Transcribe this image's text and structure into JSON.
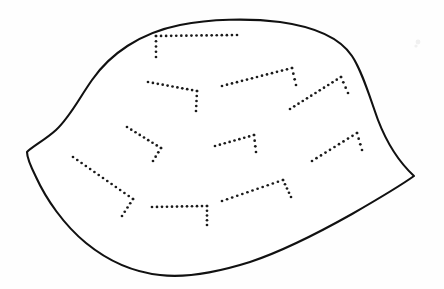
{
  "figure": {
    "title": "Shell outline with dotted growth-line markings",
    "domain_label": "line-drawing",
    "canvas": {
      "width": 444,
      "height": 289
    },
    "background_color": "#fefefe",
    "ink_color": "#111111",
    "dot_color": "#1a1a1a"
  },
  "outline": {
    "name": "shell-outline",
    "stroke_width": 2.1,
    "fill_color": "#ffffff",
    "description": "Closed lens/shell-shaped contour with a cusp at left and a cusp at right",
    "left_cusp": {
      "x": 27,
      "y": 152
    },
    "right_cusp": {
      "x": 414,
      "y": 176
    },
    "apex_top": {
      "x": 226,
      "y": 20
    },
    "apex_bottom": {
      "x": 170,
      "y": 275
    },
    "path": "M 27 152 C 33 146 45 140 56 130 C 70 117 78 100 92 80 C 110 54 140 33 180 25 C 210 19 248 18 280 22 C 316 27 340 38 352 56 C 362 71 369 95 378 120 C 388 146 400 163 414 176 C 400 186 378 199 352 214 C 320 232 286 250 250 262 C 215 273 185 278 160 275 C 132 272 108 261 86 243 C 64 225 46 199 36 177 C 30 165 27 157 27 152 Z"
  },
  "dotted_marks": [
    {
      "name": "mark-top-bracket",
      "dot_radius": 1.35,
      "spacing": 5.2,
      "segments": [
        {
          "from": {
            "x": 156,
            "y": 57
          },
          "to": {
            "x": 156,
            "y": 36
          }
        },
        {
          "from": {
            "x": 156,
            "y": 36
          },
          "to": {
            "x": 237,
            "y": 35
          }
        }
      ]
    },
    {
      "name": "mark-upper-left-chevron",
      "dot_radius": 1.35,
      "spacing": 5.2,
      "segments": [
        {
          "from": {
            "x": 148,
            "y": 82
          },
          "to": {
            "x": 197,
            "y": 91
          }
        },
        {
          "from": {
            "x": 197,
            "y": 91
          },
          "to": {
            "x": 196,
            "y": 111
          }
        }
      ]
    },
    {
      "name": "mark-upper-center-chevron",
      "dot_radius": 1.35,
      "spacing": 5.2,
      "segments": [
        {
          "from": {
            "x": 222,
            "y": 86
          },
          "to": {
            "x": 292,
            "y": 68
          }
        },
        {
          "from": {
            "x": 292,
            "y": 68
          },
          "to": {
            "x": 296,
            "y": 85
          }
        }
      ]
    },
    {
      "name": "mark-upper-right-chevron",
      "dot_radius": 1.35,
      "spacing": 5.2,
      "segments": [
        {
          "from": {
            "x": 290,
            "y": 109
          },
          "to": {
            "x": 341,
            "y": 77
          }
        },
        {
          "from": {
            "x": 341,
            "y": 77
          },
          "to": {
            "x": 348,
            "y": 93
          }
        }
      ]
    },
    {
      "name": "mark-mid-left-chevron",
      "dot_radius": 1.35,
      "spacing": 5.2,
      "segments": [
        {
          "from": {
            "x": 127,
            "y": 127
          },
          "to": {
            "x": 161,
            "y": 148
          }
        },
        {
          "from": {
            "x": 161,
            "y": 148
          },
          "to": {
            "x": 153,
            "y": 161
          }
        }
      ]
    },
    {
      "name": "mark-center-chevron",
      "dot_radius": 1.35,
      "spacing": 5.2,
      "segments": [
        {
          "from": {
            "x": 215,
            "y": 146
          },
          "to": {
            "x": 254,
            "y": 135
          }
        },
        {
          "from": {
            "x": 254,
            "y": 135
          },
          "to": {
            "x": 256,
            "y": 152
          }
        }
      ]
    },
    {
      "name": "mark-mid-right-chevron",
      "dot_radius": 1.35,
      "spacing": 5.2,
      "segments": [
        {
          "from": {
            "x": 312,
            "y": 161
          },
          "to": {
            "x": 357,
            "y": 133
          }
        },
        {
          "from": {
            "x": 357,
            "y": 133
          },
          "to": {
            "x": 362,
            "y": 150
          }
        }
      ]
    },
    {
      "name": "mark-lower-left-long-diagonal",
      "dot_radius": 1.35,
      "spacing": 5.2,
      "segments": [
        {
          "from": {
            "x": 73,
            "y": 157
          },
          "to": {
            "x": 133,
            "y": 199
          }
        },
        {
          "from": {
            "x": 133,
            "y": 199
          },
          "to": {
            "x": 122,
            "y": 216
          }
        }
      ]
    },
    {
      "name": "mark-bottom-bracket",
      "dot_radius": 1.35,
      "spacing": 5.2,
      "segments": [
        {
          "from": {
            "x": 152,
            "y": 207
          },
          "to": {
            "x": 207,
            "y": 206
          }
        },
        {
          "from": {
            "x": 207,
            "y": 206
          },
          "to": {
            "x": 207,
            "y": 225
          }
        }
      ]
    },
    {
      "name": "mark-bottom-right-chevron",
      "dot_radius": 1.35,
      "spacing": 5.2,
      "segments": [
        {
          "from": {
            "x": 222,
            "y": 201
          },
          "to": {
            "x": 283,
            "y": 180
          }
        },
        {
          "from": {
            "x": 283,
            "y": 180
          },
          "to": {
            "x": 291,
            "y": 197
          }
        }
      ]
    }
  ],
  "scan_specks": [
    {
      "x": 418,
      "y": 42,
      "r": 2.4
    },
    {
      "x": 416,
      "y": 46,
      "r": 1.6
    },
    {
      "x": 232,
      "y": 120,
      "r": 1.8
    },
    {
      "x": 96,
      "y": 168,
      "r": 1.4
    },
    {
      "x": 298,
      "y": 176,
      "r": 1.6
    },
    {
      "x": 146,
      "y": 250,
      "r": 1.5
    },
    {
      "x": 236,
      "y": 252,
      "r": 1.5
    }
  ]
}
